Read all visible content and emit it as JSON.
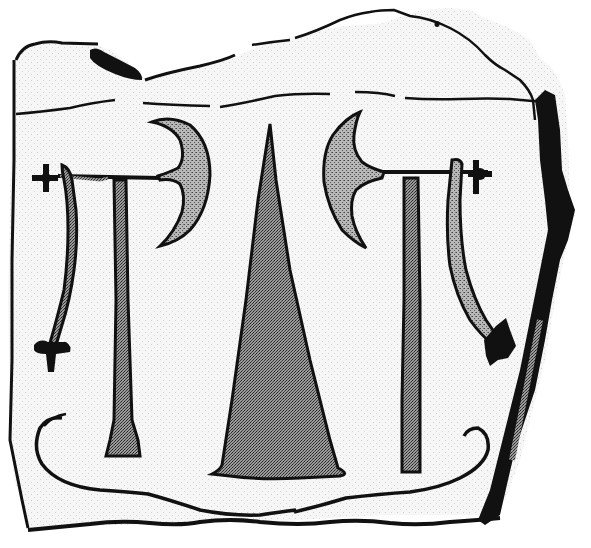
{
  "image": {
    "description": "Line drawing of a carved stone slab showing two double-headed-style axes, a central cone/triangle, two swords, and a ship outline beneath",
    "width": 591,
    "height": 548
  },
  "colors": {
    "background": "#ffffff",
    "stone": "#f4f4f4",
    "ink": "#111111",
    "stipple_fill": "#9a9a9a",
    "cone_fill": "#8c8c8c"
  },
  "figures": [
    {
      "name": "left-axe",
      "kind": "axe"
    },
    {
      "name": "left-sword",
      "kind": "sword"
    },
    {
      "name": "central-cone",
      "kind": "triangle"
    },
    {
      "name": "right-axe",
      "kind": "axe"
    },
    {
      "name": "right-sword",
      "kind": "sword"
    },
    {
      "name": "ship",
      "kind": "ship-outline"
    }
  ]
}
